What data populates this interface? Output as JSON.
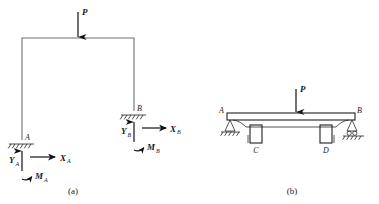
{
  "figure": {
    "background_color": "#ffffff",
    "line_color": "#1f1f1f",
    "member_color": "#6e6e6e"
  },
  "panel_a": {
    "caption": "(a)",
    "description": "Portal frame with two fixed supports and a vertical point load",
    "load": {
      "label": "P",
      "direction": "down",
      "icon": "down-arrow-icon"
    },
    "supports": [
      {
        "id": "A",
        "point_label": "A",
        "type": "fixed",
        "icon": "fixed-support-hatch-icon",
        "reactions": [
          {
            "label": "Y",
            "subscript": "A",
            "direction": "up",
            "icon": "up-arrow-icon"
          },
          {
            "label": "X",
            "subscript": "A",
            "direction": "right",
            "icon": "right-arrow-icon"
          },
          {
            "label": "M",
            "subscript": "A",
            "direction": "moment",
            "icon": "moment-arc-icon"
          }
        ]
      },
      {
        "id": "B",
        "point_label": "B",
        "type": "fixed",
        "icon": "fixed-support-hatch-icon",
        "reactions": [
          {
            "label": "Y",
            "subscript": "B",
            "direction": "up",
            "icon": "up-arrow-icon"
          },
          {
            "label": "X",
            "subscript": "B",
            "direction": "right",
            "icon": "right-arrow-icon"
          },
          {
            "label": "M",
            "subscript": "B",
            "direction": "moment",
            "icon": "moment-arc-icon"
          }
        ]
      }
    ]
  },
  "panel_b": {
    "caption": "(b)",
    "description": "Beam on pin and roller supports with two intermediate columns",
    "load": {
      "label": "P",
      "direction": "down",
      "icon": "down-arrow-icon"
    },
    "points": [
      {
        "id": "A",
        "label": "A",
        "support": "pin",
        "icon": "pin-support-icon"
      },
      {
        "id": "B",
        "label": "B",
        "support": "roller",
        "icon": "roller-support-icon"
      },
      {
        "id": "C",
        "label": "C",
        "support": "column",
        "icon": "column-icon"
      },
      {
        "id": "D",
        "label": "D",
        "support": "column",
        "icon": "column-icon"
      }
    ]
  }
}
